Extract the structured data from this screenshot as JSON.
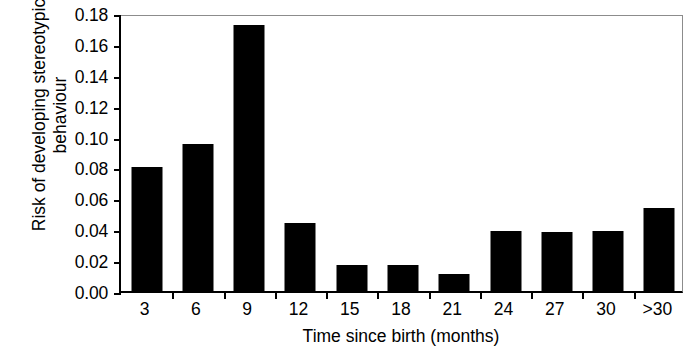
{
  "chart_data": {
    "type": "bar",
    "title": "",
    "xlabel": "Time since birth (months)",
    "ylabel_line1": "Risk of developing stereotypic",
    "ylabel_line2": "behaviour",
    "ylabel": "Risk of developing stereotypic behaviour",
    "categories": [
      "3",
      "6",
      "9",
      "12",
      "15",
      "18",
      "21",
      "24",
      "27",
      "30",
      ">30"
    ],
    "values": [
      0.08,
      0.095,
      0.172,
      0.044,
      0.017,
      0.017,
      0.011,
      0.039,
      0.038,
      0.039,
      0.054
    ],
    "ylim": [
      0.0,
      0.18
    ],
    "ytick_values": [
      0.0,
      0.02,
      0.04,
      0.06,
      0.08,
      0.1,
      0.12,
      0.14,
      0.16,
      0.18
    ],
    "ytick_labels": [
      "0.00",
      "0.02",
      "0.04",
      "0.06",
      "0.08",
      "0.10",
      "0.12",
      "0.14",
      "0.16",
      "0.18"
    ],
    "grid": false,
    "legend": false,
    "bar_color": "#000000",
    "axis_color": "#000000",
    "background_color": "#ffffff"
  }
}
